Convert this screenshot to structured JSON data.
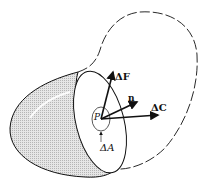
{
  "figure": {
    "labels": {
      "delta_f": "ΔF",
      "normal": "n",
      "delta_c": "ΔC",
      "point": "P",
      "delta_a": "ΔA"
    },
    "colors": {
      "stroke": "#111111",
      "shaded_face": "#d4d4d4",
      "background": "#ffffff"
    }
  }
}
